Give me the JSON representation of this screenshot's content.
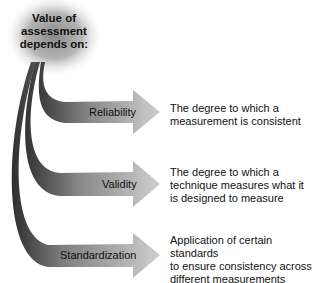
{
  "diagram": {
    "hub": {
      "line1": "Value of",
      "line2": "assessment",
      "line3": "depends on:"
    },
    "branches": [
      {
        "label": "Reliability",
        "description_lines": [
          "The degree to which a",
          "measurement is consistent"
        ]
      },
      {
        "label": "Validity",
        "description_lines": [
          "The degree to which a",
          "technique measures what it",
          "is designed to measure"
        ]
      },
      {
        "label": "Standardization",
        "description_lines": [
          "Application of certain standards",
          "to ensure consistency across",
          "different measurements"
        ]
      }
    ],
    "colors": {
      "hub_center": "#9a9a9a",
      "hub_edge": "#ffffff",
      "arrow_dark": "#3a3a3a",
      "arrow_light": "#c8c8c8",
      "text": "#111111"
    }
  }
}
